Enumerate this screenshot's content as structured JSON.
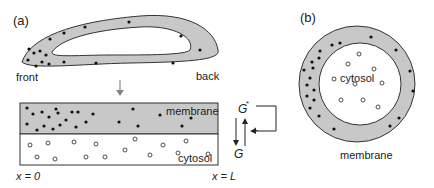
{
  "panel_a": {
    "label": "(a)",
    "cell_labels": {
      "front": "front",
      "back": "back"
    },
    "strip": {
      "membrane_label": "membrane",
      "cytosol_label": "cytosol",
      "x_left": "x = 0",
      "x_right": "x = L"
    },
    "cycle": {
      "active": "G",
      "active_sup": "*",
      "inactive": "G",
      "feedback_sign": "+"
    }
  },
  "panel_b": {
    "label": "(b)",
    "cytosol_label": "cytosol",
    "membrane_label": "membrane"
  },
  "colors": {
    "membrane_fill": "#c8c8c8",
    "outline": "#333333",
    "particle": "#111111",
    "arrow_gray": "#888888"
  }
}
